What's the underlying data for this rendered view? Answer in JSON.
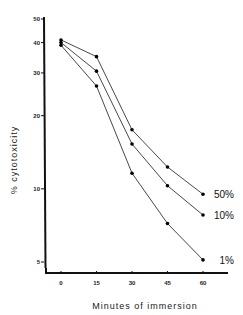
{
  "chart_data": {
    "type": "line",
    "title": "",
    "xlabel": "Minutes of immersion",
    "ylabel": "% cytotoxicity",
    "yscale": "log",
    "ylim": [
      5,
      50
    ],
    "xlim": [
      -5,
      67
    ],
    "x": [
      0,
      15,
      30,
      45,
      60
    ],
    "x_ticks": [
      "0",
      "15",
      "30",
      "45",
      "60"
    ],
    "y_ticks": [
      {
        "value": 50,
        "label": "50"
      },
      {
        "value": 40,
        "label": "40"
      },
      {
        "value": 30,
        "label": "30"
      },
      {
        "value": 20,
        "label": "20"
      },
      {
        "value": 10,
        "label": "10"
      },
      {
        "value": 5,
        "label": "5"
      }
    ],
    "grid": false,
    "legend": "inline labels at line ends",
    "series": [
      {
        "name": "50%",
        "values": [
          41,
          35,
          17.5,
          12.3,
          9.5
        ]
      },
      {
        "name": "10%",
        "values": [
          40,
          30.5,
          15.3,
          10.3,
          7.8
        ]
      },
      {
        "name": "1%",
        "values": [
          39,
          26.5,
          11.6,
          7.2,
          5.1
        ]
      }
    ]
  },
  "labels": {
    "xlabel": "Minutes of immersion",
    "ylabel": "% cytotoxicity"
  }
}
